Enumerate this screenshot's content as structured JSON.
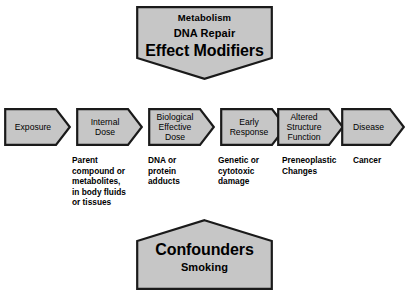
{
  "diagram": {
    "colors": {
      "shape_fill": "#c6c6c6",
      "shape_stroke": "#1a1a1a",
      "text": "#000000",
      "background": "#ffffff"
    },
    "top_block": {
      "name": "effect-modifiers",
      "lines": [
        {
          "text": "Metabolism",
          "size": "small"
        },
        {
          "text": "DNA Repair",
          "size": "med"
        },
        {
          "text": "Effect Modifiers",
          "size": "big"
        }
      ]
    },
    "bottom_block": {
      "name": "confounders",
      "lines": [
        {
          "text": "Confounders",
          "size": "big"
        },
        {
          "text": "Smoking",
          "size": "med"
        }
      ]
    },
    "stages": [
      {
        "id": "exposure",
        "label": "Exposure",
        "caption": ""
      },
      {
        "id": "internal-dose",
        "label": "Internal\nDose",
        "caption": "Parent\ncompound or\nmetabolites,\nin body fluids\nor tissues"
      },
      {
        "id": "biological-effective-dose",
        "label": "Biological\nEffective\nDose",
        "caption": "DNA or\nprotein\nadducts"
      },
      {
        "id": "early-response",
        "label": "Early\nResponse",
        "caption": "Genetic or\ncytotoxic\ndamage"
      },
      {
        "id": "altered-structure-function",
        "label": "Altered\nStructure\nFunction",
        "caption": "Preneoplastic\nChanges"
      },
      {
        "id": "disease",
        "label": "Disease",
        "caption": "Cancer"
      }
    ]
  }
}
